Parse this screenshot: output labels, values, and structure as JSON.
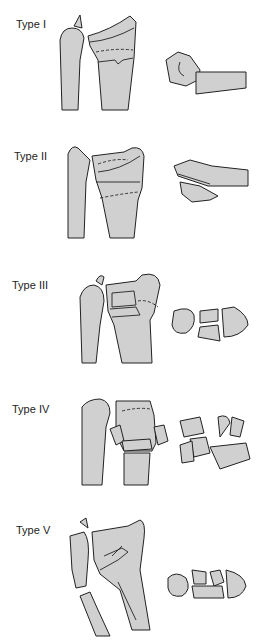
{
  "figure": {
    "panels": [
      {
        "label": "Type I"
      },
      {
        "label": "Type II"
      },
      {
        "label": "Type III"
      },
      {
        "label": "Type IV"
      },
      {
        "label": "Type V"
      }
    ],
    "colors": {
      "bone_fill": "#d0d0d0",
      "outline": "#222222",
      "background": "#ffffff"
    }
  }
}
